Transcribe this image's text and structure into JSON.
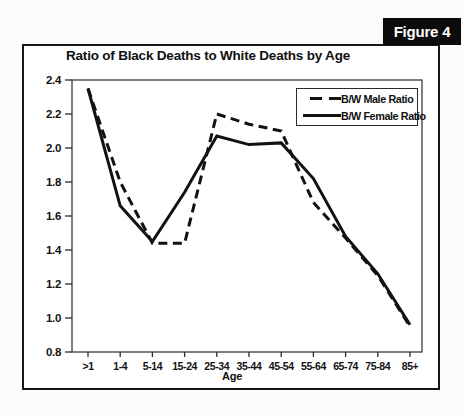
{
  "figure_label": "Figure 4",
  "chart": {
    "title": "Ratio of Black Deaths to White Deaths by Age",
    "x_axis_label": "Age"
  },
  "legend": {
    "male_label": "B/W Male Ratio",
    "female_label": "B/W Female Ratio"
  },
  "colors": {
    "line": "#121212",
    "frame": "#2b2b2b",
    "badge_bg": "#0b0b0b",
    "badge_text": "#ffffff",
    "chart_bg": "#ffffff"
  },
  "chart_data": {
    "type": "line",
    "title": "Ratio of Black Deaths to White Deaths by Age",
    "xlabel": "Age",
    "ylabel": "",
    "categories": [
      ">1",
      "1-4",
      "5-14",
      "15-24",
      "25-34",
      "35-44",
      "45-54",
      "55-64",
      "65-74",
      "75-84",
      "85+"
    ],
    "series": [
      {
        "name": "B/W Male Ratio",
        "style": "dashed",
        "values": [
          2.35,
          1.8,
          1.44,
          1.44,
          2.2,
          2.14,
          2.1,
          1.68,
          1.47,
          1.25,
          0.95
        ]
      },
      {
        "name": "B/W Female Ratio",
        "style": "solid",
        "values": [
          2.35,
          1.66,
          1.45,
          1.74,
          2.07,
          2.02,
          2.03,
          1.82,
          1.48,
          1.26,
          0.96
        ]
      }
    ],
    "ylim": [
      0.8,
      2.4
    ],
    "ytick_labels": [
      "2.4",
      "2.2",
      "2.0",
      "1.8",
      "1.6",
      "1.4",
      "1.2",
      "1.0",
      "0.8"
    ],
    "grid": false,
    "legend_position": "top-right"
  }
}
